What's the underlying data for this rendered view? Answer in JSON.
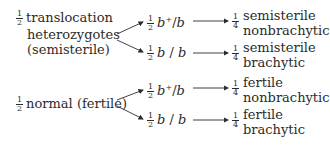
{
  "diagram": {
    "type": "genetic-cross-branching",
    "groups": [
      {
        "id": "translocation",
        "fraction": {
          "num": "1",
          "den": "2"
        },
        "label_lines": [
          "translocation",
          "heterozygotes",
          "(semisterile)"
        ],
        "branches": [
          {
            "fraction": {
              "num": "1",
              "den": "2"
            },
            "genotype": {
              "allele1": "b",
              "sup": "+",
              "sep": "/",
              "allele2": "b"
            },
            "result": {
              "fraction": {
                "num": "1",
                "den": "4"
              },
              "lines": [
                "semisterile",
                "nonbrachytic"
              ]
            }
          },
          {
            "fraction": {
              "num": "1",
              "den": "2"
            },
            "genotype": {
              "allele1": "b",
              "sup": "",
              "sep": " / ",
              "allele2": "b"
            },
            "result": {
              "fraction": {
                "num": "1",
                "den": "4"
              },
              "lines": [
                "semisterile",
                "brachytic"
              ]
            }
          }
        ]
      },
      {
        "id": "normal",
        "fraction": {
          "num": "1",
          "den": "2"
        },
        "label_lines": [
          "normal (fertile)"
        ],
        "branches": [
          {
            "fraction": {
              "num": "1",
              "den": "2"
            },
            "genotype": {
              "allele1": "b",
              "sup": "+",
              "sep": "/",
              "allele2": "b"
            },
            "result": {
              "fraction": {
                "num": "1",
                "den": "4"
              },
              "lines": [
                "fertile",
                "nonbrachytic"
              ]
            }
          },
          {
            "fraction": {
              "num": "1",
              "den": "2"
            },
            "genotype": {
              "allele1": "b",
              "sup": "",
              "sep": " / ",
              "allele2": "b"
            },
            "result": {
              "fraction": {
                "num": "1",
                "den": "4"
              },
              "lines": [
                "fertile",
                "brachytic"
              ]
            }
          }
        ]
      }
    ],
    "colors": {
      "text": "#2b2b2b",
      "arrow": "#2b2b2b",
      "background": "#ffffff"
    }
  }
}
